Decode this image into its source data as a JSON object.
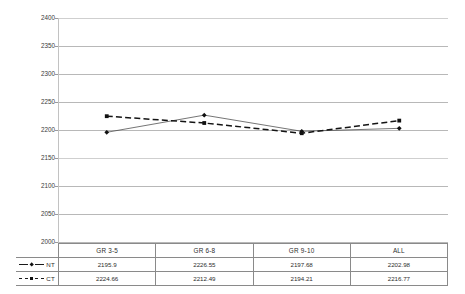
{
  "chart_data": {
    "type": "line",
    "title": "",
    "xlabel": "",
    "ylabel": "SCALED SCORE",
    "categories": [
      "GR 3-5",
      "GR 6-8",
      "GR 9-10",
      "ALL"
    ],
    "ylim": [
      2000,
      2400
    ],
    "ytick_step": 50,
    "yticks": [
      "2400",
      "2350",
      "2300",
      "2250",
      "2200",
      "2150",
      "2100",
      "2050",
      "2000"
    ],
    "grid": true,
    "legend_position": "table-left",
    "series": [
      {
        "name": "NT",
        "marker": "diamond",
        "line_style": "solid",
        "values": [
          2195.9,
          2226.55,
          2197.68,
          2202.98
        ],
        "labels": [
          "2195.9",
          "2226.55",
          "2197.68",
          "2202.98"
        ]
      },
      {
        "name": "CT",
        "marker": "square",
        "line_style": "dashed",
        "values": [
          2224.66,
          2212.49,
          2194.21,
          2216.77
        ],
        "labels": [
          "2224.66",
          "2212.49",
          "2194.21",
          "2216.77"
        ]
      }
    ]
  },
  "axis": {
    "y_title": "SCALED SCORE",
    "ticks": [
      {
        "label": "2400"
      },
      {
        "label": "2350"
      },
      {
        "label": "2300"
      },
      {
        "label": "2250"
      },
      {
        "label": "2200"
      },
      {
        "label": "2150"
      },
      {
        "label": "2100"
      },
      {
        "label": "2050"
      },
      {
        "label": "2000"
      }
    ]
  },
  "table": {
    "columns": [
      "GR 3-5",
      "GR 6-8",
      "GR 9-10",
      "ALL"
    ],
    "rows": [
      {
        "legend": "NT",
        "marker": "diamond",
        "line_style": "solid",
        "cells": [
          "2195.9",
          "2226.55",
          "2197.68",
          "2202.98"
        ]
      },
      {
        "legend": "CT",
        "marker": "square",
        "line_style": "dashed",
        "cells": [
          "2224.66",
          "2212.49",
          "2194.21",
          "2216.77"
        ]
      }
    ]
  },
  "colors": {
    "series_nt": "#111111",
    "series_ct": "#1a1a1a",
    "gridline": "#b8b8b8",
    "text": "#2b2b2b"
  }
}
